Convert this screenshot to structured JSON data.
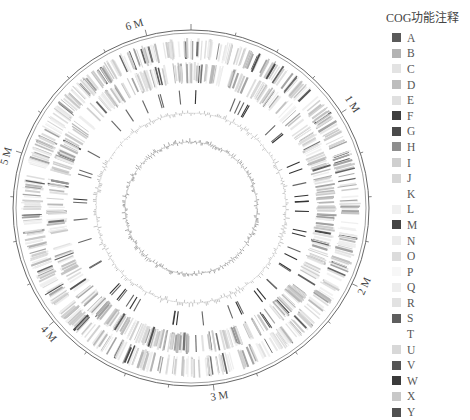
{
  "figure": {
    "type": "circular-genome-map",
    "center": [
      191,
      208
    ],
    "outer_radius": 178,
    "genome_size_mb": 6.3,
    "scale_labels": [
      {
        "label": "6 M",
        "value": 6
      },
      {
        "label": "1 M",
        "value": 1
      },
      {
        "label": "2 M",
        "value": 2
      },
      {
        "label": "3 M",
        "value": 3
      },
      {
        "label": "4 M",
        "value": 4
      },
      {
        "label": "5 M",
        "value": 5
      }
    ],
    "tracks": [
      {
        "name": "genome-scale-ring",
        "radius": 178
      },
      {
        "name": "cog-forward-strand",
        "r_inner": 148,
        "r_outer": 170
      },
      {
        "name": "cog-reverse-strand",
        "r_inner": 124,
        "r_outer": 146
      },
      {
        "name": "ncRNA-track",
        "r_inner": 104,
        "r_outer": 118
      },
      {
        "name": "gc-content",
        "radius": 95
      },
      {
        "name": "gc-skew",
        "radius": 66
      }
    ]
  },
  "legend": {
    "title": "COG功能注释",
    "items": [
      {
        "label": "A",
        "color": "#5a5a5a"
      },
      {
        "label": "B",
        "color": "#b3b3b3"
      },
      {
        "label": "C",
        "color": "#e3e3e3"
      },
      {
        "label": "D",
        "color": "#bdbdbd"
      },
      {
        "label": "E",
        "color": "#e0e0e0"
      },
      {
        "label": "F",
        "color": "#3e3e3e"
      },
      {
        "label": "G",
        "color": "#4a4a4a"
      },
      {
        "label": "H",
        "color": "#8e8e8e"
      },
      {
        "label": "I",
        "color": "#cfcfcf"
      },
      {
        "label": "J",
        "color": "#d6d6d6"
      },
      {
        "label": "K",
        "color": "#ffffff"
      },
      {
        "label": "L",
        "color": "#f0f0f0"
      },
      {
        "label": "M",
        "color": "#444444"
      },
      {
        "label": "N",
        "color": "#ececec"
      },
      {
        "label": "O",
        "color": "#dcdcdc"
      },
      {
        "label": "P",
        "color": "#f7f7f7"
      },
      {
        "label": "Q",
        "color": "#eeeeee"
      },
      {
        "label": "R",
        "color": "#e2e2e2"
      },
      {
        "label": "S",
        "color": "#5e5e5e"
      },
      {
        "label": "T",
        "color": "#ffffff"
      },
      {
        "label": "U",
        "color": "#d8d8d8"
      },
      {
        "label": "V",
        "color": "#555555"
      },
      {
        "label": "W",
        "color": "#3a3a3a"
      },
      {
        "label": "X",
        "color": "#c8c8c8"
      },
      {
        "label": "Y",
        "color": "#505050"
      }
    ]
  }
}
